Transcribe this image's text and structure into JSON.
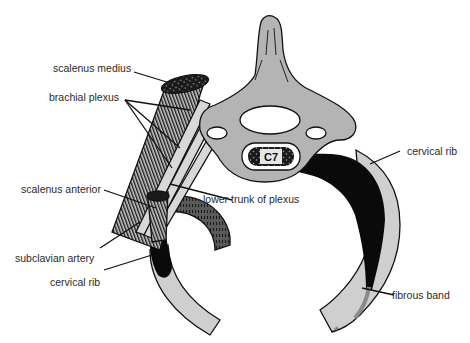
{
  "figure": {
    "type": "anatomical-diagram",
    "vertebra_label": "C7",
    "artist_mark": "MK",
    "colors": {
      "bone": "#b4b4b4",
      "rib_light": "#cfcfcf",
      "dark_tissue": "#0a0a0a",
      "artery": "#555555",
      "muscle": "#3a3a3a",
      "outline": "#111111",
      "label_text": "#2a2a2a",
      "background": "#ffffff"
    }
  },
  "labels": {
    "scalenus_medius": "scalenus medius",
    "brachial_plexus": "brachial plexus",
    "scalenus_anterior": "scalenus anterior",
    "lower_trunk": "lower trunk of plexus",
    "subclavian_artery": "subclavian artery",
    "cervical_rib_left": "cervical rib",
    "cervical_rib_right": "cervical rib",
    "fibrous_band": "fibrous band"
  }
}
